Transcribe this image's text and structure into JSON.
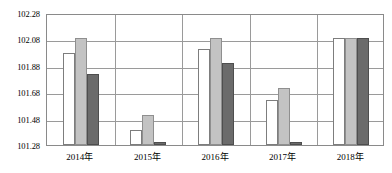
{
  "chart_data": {
    "type": "bar",
    "title": "",
    "xlabel": "",
    "ylabel": "",
    "categories": [
      "2014年",
      "2015年",
      "2016年",
      "2017年",
      "2018年"
    ],
    "ylim": [
      101.28,
      102.28
    ],
    "yticks": [
      "101.28",
      "101.48",
      "101.68",
      "101.88",
      "102.08",
      "102.28"
    ],
    "ytick_values": [
      101.28,
      101.48,
      101.68,
      101.88,
      102.08,
      102.28
    ],
    "grid": true,
    "legend": "none",
    "series": [
      {
        "name": "series-1",
        "color": "#ffffff",
        "values": [
          101.98,
          101.39,
          102.01,
          101.62,
          102.09
        ]
      },
      {
        "name": "series-2",
        "color": "#c3c3c3",
        "values": [
          102.09,
          101.51,
          102.09,
          101.71,
          102.09
        ]
      },
      {
        "name": "series-3",
        "color": "#6b6b6b",
        "values": [
          101.82,
          101.3,
          101.9,
          101.3,
          102.09
        ]
      }
    ]
  }
}
